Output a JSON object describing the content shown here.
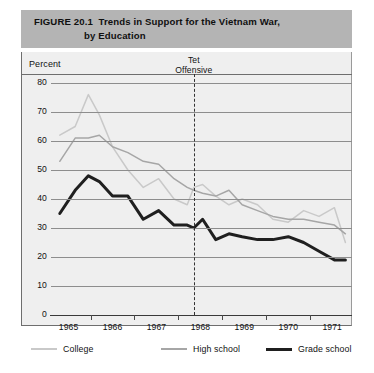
{
  "figure": {
    "number": "FIGURE 20.1",
    "title_line1": "Trends in Support for the Vietnam War,",
    "title_line2": "by Education"
  },
  "axis": {
    "y_label": "Percent",
    "y_ticks": [
      "80",
      "70",
      "60",
      "50",
      "40",
      "30",
      "20",
      "10",
      "0"
    ],
    "x_ticks": [
      "1965",
      "1966",
      "1967",
      "1968",
      "1969",
      "1970",
      "1971"
    ]
  },
  "annotation": {
    "tet_line1": "Tet",
    "tet_line2": "Offensive"
  },
  "legend": {
    "items": [
      {
        "label": "College",
        "color": "#c9c9c9"
      },
      {
        "label": "High school",
        "color": "#a6a6a6"
      },
      {
        "label": "Grade school",
        "color": "#1f1f1f"
      }
    ]
  },
  "chart_data": {
    "type": "line",
    "xlabel": "",
    "ylabel": "Percent",
    "ylim": [
      0,
      80
    ],
    "xlim": [
      1964.75,
      1971.6
    ],
    "grid": true,
    "legend_position": "bottom",
    "annotations": [
      {
        "text": "Tet Offensive",
        "x": 1968.0,
        "type": "vertical-dashed-line"
      }
    ],
    "series": [
      {
        "name": "College",
        "color": "#c9c9c9",
        "x": [
          1964.95,
          1965.3,
          1965.6,
          1965.85,
          1966.15,
          1966.5,
          1966.85,
          1967.2,
          1967.55,
          1967.85,
          1968.0,
          1968.2,
          1968.5,
          1968.8,
          1969.1,
          1969.45,
          1969.8,
          1970.15,
          1970.5,
          1970.85,
          1971.2,
          1971.45
        ],
        "y": [
          62,
          65,
          76,
          69,
          58,
          50,
          44,
          47,
          40,
          38,
          44,
          45,
          41,
          38,
          40,
          38,
          33,
          32,
          36,
          34,
          37,
          25
        ]
      },
      {
        "name": "High school",
        "color": "#a6a6a6",
        "x": [
          1964.95,
          1965.3,
          1965.6,
          1965.85,
          1966.15,
          1966.5,
          1966.85,
          1967.2,
          1967.55,
          1967.85,
          1968.0,
          1968.2,
          1968.5,
          1968.8,
          1969.1,
          1969.45,
          1969.8,
          1970.15,
          1970.5,
          1970.85,
          1971.2,
          1971.45
        ],
        "y": [
          53,
          61,
          61,
          62,
          58,
          56,
          53,
          52,
          47,
          44,
          43,
          42,
          41,
          43,
          38,
          36,
          34,
          33,
          33,
          32,
          31,
          28
        ]
      },
      {
        "name": "Grade school",
        "color": "#1f1f1f",
        "x": [
          1964.95,
          1965.3,
          1965.6,
          1965.85,
          1966.15,
          1966.5,
          1966.85,
          1967.2,
          1967.55,
          1967.85,
          1968.0,
          1968.2,
          1968.5,
          1968.8,
          1969.1,
          1969.45,
          1969.8,
          1970.15,
          1970.5,
          1970.85,
          1971.2,
          1971.45
        ],
        "y": [
          35,
          43,
          48,
          46,
          41,
          41,
          33,
          36,
          31,
          31,
          30,
          33,
          26,
          28,
          27,
          26,
          26,
          27,
          25,
          22,
          19,
          19
        ]
      }
    ]
  }
}
